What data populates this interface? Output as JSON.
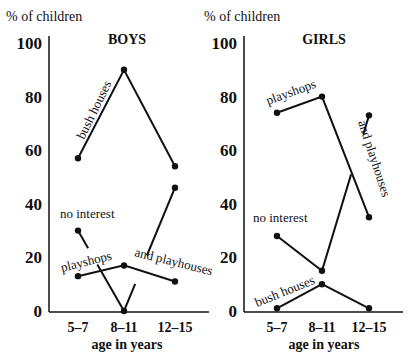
{
  "chart_data": [
    {
      "type": "line",
      "title": "BOYS",
      "ylabel": "% of children",
      "xlabel": "age in years",
      "categories": [
        "5–7",
        "8–11",
        "12–15"
      ],
      "yticks": [
        0,
        20,
        40,
        60,
        80,
        100
      ],
      "ylim": [
        0,
        100
      ],
      "grid": false,
      "series": [
        {
          "name": "bush houses",
          "values": [
            57,
            90,
            54
          ]
        },
        {
          "name": "playshops and playhouses",
          "values": [
            13,
            17,
            11
          ]
        },
        {
          "name": "no interest",
          "values": [
            30,
            0,
            46
          ]
        }
      ],
      "annotations": [
        "bush houses",
        "no interest",
        "playshops",
        "and playhouses"
      ]
    },
    {
      "type": "line",
      "title": "GIRLS",
      "ylabel": "% of children",
      "xlabel": "age in years",
      "categories": [
        "5–7",
        "8–11",
        "12–15"
      ],
      "yticks": [
        0,
        20,
        40,
        60,
        80,
        100
      ],
      "ylim": [
        0,
        100
      ],
      "grid": false,
      "series": [
        {
          "name": "playshops and playhouses",
          "values": [
            74,
            80,
            35
          ]
        },
        {
          "name": "no interest",
          "values": [
            28,
            15,
            73
          ]
        },
        {
          "name": "bush houses",
          "values": [
            1,
            10,
            1
          ]
        }
      ],
      "annotations": [
        "playshops",
        "and playhouses",
        "no interest",
        "bush houses"
      ]
    }
  ],
  "panels": [
    {
      "title": "BOYS",
      "ylabel": "% of children",
      "xlabel": "age in years",
      "labels": {
        "bush_houses": "bush houses",
        "no_interest": "no interest",
        "playshops": "playshops",
        "and_playhouses": "and playhouses"
      }
    },
    {
      "title": "GIRLS",
      "ylabel": "% of children",
      "xlabel": "age in years",
      "labels": {
        "playshops": "playshops",
        "and_playhouses": "and playhouses",
        "no_interest": "no interest",
        "bush_houses": "bush houses"
      }
    }
  ]
}
